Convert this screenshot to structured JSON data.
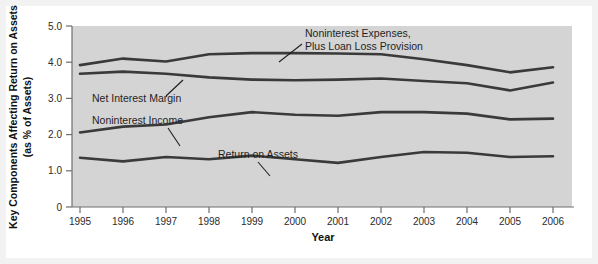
{
  "chart_data": {
    "type": "line",
    "title": "",
    "xlabel": "Year",
    "ylabel": "Key Components Affecting Return on Assets (as % of Assets)",
    "ylabel_line1": "Key Components Affecting Return on Assets",
    "ylabel_line2": "(as % of Assets)",
    "categories": [
      "1995",
      "1996",
      "1997",
      "1998",
      "1999",
      "2000",
      "2001",
      "2002",
      "2003",
      "2004",
      "2005",
      "2006"
    ],
    "x": [
      1995,
      1996,
      1997,
      1998,
      1999,
      2000,
      2001,
      2002,
      2003,
      2004,
      2005,
      2006
    ],
    "xlim": [
      1995,
      2006
    ],
    "ylim": [
      0,
      5.0
    ],
    "yticks": [
      0,
      1.0,
      2.0,
      3.0,
      4.0,
      5.0
    ],
    "ytick_labels": [
      "0",
      "1.0",
      "2.0",
      "3.0",
      "4.0",
      "5.0"
    ],
    "grid": false,
    "legend_position": "inline-annotations",
    "line_color": "#3a3a3a",
    "plot_background": "#d4d4d4",
    "series": [
      {
        "name": "Noninterest Expenses, Plus Loan Loss Provision",
        "label_line1": "Noninterest Expenses,",
        "label_line2": "Plus Loan Loss Provision",
        "values": [
          3.92,
          4.1,
          4.02,
          4.22,
          4.25,
          4.25,
          4.24,
          4.22,
          4.08,
          3.92,
          3.72,
          3.86
        ]
      },
      {
        "name": "Net Interest Margin",
        "values": [
          3.68,
          3.74,
          3.68,
          3.58,
          3.52,
          3.5,
          3.52,
          3.55,
          3.48,
          3.42,
          3.22,
          3.44
        ]
      },
      {
        "name": "Noninterest Income",
        "values": [
          2.06,
          2.22,
          2.28,
          2.48,
          2.62,
          2.55,
          2.52,
          2.62,
          2.62,
          2.58,
          2.42,
          2.44
        ]
      },
      {
        "name": "Return on Assets",
        "values": [
          1.36,
          1.26,
          1.38,
          1.32,
          1.42,
          1.32,
          1.22,
          1.38,
          1.52,
          1.5,
          1.38,
          1.4
        ]
      }
    ],
    "annotations": [
      {
        "text": "Noninterest Expenses, Plus Loan Loss Provision",
        "anchor_year": 2000,
        "position": "above-right"
      },
      {
        "text": "Net Interest Margin",
        "anchor_year": 1998,
        "position": "below-left"
      },
      {
        "text": "Noninterest Income",
        "anchor_year": 1997,
        "position": "above-left"
      },
      {
        "text": "Return on Assets",
        "anchor_year": 1999,
        "position": "above"
      }
    ]
  }
}
